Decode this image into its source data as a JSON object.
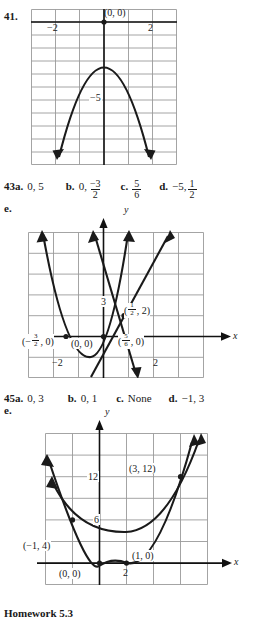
{
  "page": {
    "footer": "Homework 5.3"
  },
  "problem41": {
    "number": "41.",
    "graph": {
      "type": "scatter",
      "axis_labels": {
        "x": "",
        "y": ""
      },
      "tick_labels": [
        {
          "text": "−2",
          "x": -2,
          "y": 0
        },
        {
          "text": "2",
          "x": 2,
          "y": 0
        },
        {
          "text": "−5",
          "x": 0,
          "y": -5
        }
      ],
      "points": [
        {
          "text": "(0, 0)",
          "x": 0,
          "y": 0
        }
      ],
      "curve": "downward parabola vertex (0,0)",
      "xlim": [
        -3,
        3
      ],
      "ylim": [
        -11,
        1
      ],
      "grid": true
    }
  },
  "problem43": {
    "number": "43a.",
    "answers": [
      {
        "letter": "",
        "value": "0, 5"
      },
      {
        "letter": "b.",
        "value_prefix": "0,",
        "fraction": {
          "num": "−3",
          "den": "2"
        }
      },
      {
        "letter": "c.",
        "fraction": {
          "num": "5",
          "den": "6"
        }
      },
      {
        "letter": "d.",
        "value_prefix": "−5,",
        "fraction": {
          "num": "1",
          "den": "2"
        }
      }
    ],
    "e_label": "e.",
    "graph": {
      "type": "scatter",
      "axis_labels": {
        "x": "x",
        "y": "y"
      },
      "tick_labels": [
        {
          "text": "3",
          "x": 0,
          "y": 3
        },
        {
          "text": "−2",
          "x": -2,
          "y": 0
        },
        {
          "text": "2",
          "x": 2,
          "y": 0
        }
      ],
      "points": [
        {
          "text": "(−3/2, 0)",
          "x": -1.5,
          "y": 0,
          "num": "3",
          "den": "2",
          "sign": "−",
          "tail": ", 0)"
        },
        {
          "text": "(0, 0)",
          "x": 0,
          "y": 0
        },
        {
          "text": "(5/6, 0)",
          "x": 0.8333,
          "y": 0,
          "num": "5",
          "den": "6",
          "sign": "",
          "tail": ", 0)"
        },
        {
          "text": "(1/2, 2)",
          "x": 0.5,
          "y": 2,
          "num": "1",
          "den": "2",
          "sign": "",
          "tail": ", 2)"
        }
      ],
      "curves": [
        "upward parabola",
        "steep line",
        "steep negative line"
      ],
      "xlim": [
        -3.2,
        3
      ],
      "ylim": [
        -1.6,
        5.5
      ],
      "grid": true
    }
  },
  "problem45": {
    "number": "45a.",
    "answers": [
      {
        "letter": "",
        "value": "0, 3"
      },
      {
        "letter": "b.",
        "value": "0, 1"
      },
      {
        "letter": "c.",
        "value": "None"
      },
      {
        "letter": "d.",
        "value": "−1, 3"
      }
    ],
    "e_label": "e.",
    "graph": {
      "type": "scatter",
      "axis_labels": {
        "x": "x",
        "y": "y"
      },
      "tick_labels": [
        {
          "text": "12",
          "x": 0,
          "y": 12
        },
        {
          "text": "6",
          "x": 0,
          "y": 6
        },
        {
          "text": "2",
          "x": 2,
          "y": 0
        }
      ],
      "points": [
        {
          "text": "(3, 12)",
          "x": 3,
          "y": 12
        },
        {
          "text": "(−1, 4)",
          "x": -1,
          "y": 4
        },
        {
          "text": "(1, 0)",
          "x": 1,
          "y": 0
        },
        {
          "text": "(0, 0)",
          "x": 0,
          "y": 0
        }
      ],
      "curves": [
        "upward parabola through (0,0)",
        "flatter upward parabola"
      ],
      "xlim": [
        -2.4,
        4.5
      ],
      "ylim": [
        -2,
        17
      ],
      "grid": true
    }
  },
  "colors": {
    "ink": "#1a1a1a",
    "grid": "#9a9a9a",
    "axis": "#111111"
  }
}
